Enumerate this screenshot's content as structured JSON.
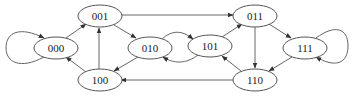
{
  "diagram": {
    "type": "state-transition-graph",
    "nodes": [
      {
        "id": "000",
        "label": "000",
        "cx": 56,
        "cy": 48
      },
      {
        "id": "001",
        "label": "001",
        "cx": 100,
        "cy": 16
      },
      {
        "id": "010",
        "label": "010",
        "cx": 150,
        "cy": 48
      },
      {
        "id": "100",
        "label": "100",
        "cx": 100,
        "cy": 80
      },
      {
        "id": "101",
        "label": "101",
        "cx": 210,
        "cy": 46
      },
      {
        "id": "011",
        "label": "011",
        "cx": 255,
        "cy": 16
      },
      {
        "id": "111",
        "label": "111",
        "cx": 305,
        "cy": 48
      },
      {
        "id": "110",
        "label": "110",
        "cx": 255,
        "cy": 80
      }
    ],
    "edges": [
      {
        "from": "000",
        "to": "000"
      },
      {
        "from": "000",
        "to": "001"
      },
      {
        "from": "001",
        "to": "010"
      },
      {
        "from": "001",
        "to": "011"
      },
      {
        "from": "010",
        "to": "101"
      },
      {
        "from": "101",
        "to": "010"
      },
      {
        "from": "010",
        "to": "100"
      },
      {
        "from": "100",
        "to": "000"
      },
      {
        "from": "100",
        "to": "001"
      },
      {
        "from": "101",
        "to": "011"
      },
      {
        "from": "011",
        "to": "110"
      },
      {
        "from": "011",
        "to": "111"
      },
      {
        "from": "111",
        "to": "111"
      },
      {
        "from": "111",
        "to": "110"
      },
      {
        "from": "110",
        "to": "101"
      },
      {
        "from": "110",
        "to": "100"
      }
    ],
    "colors": {
      "stroke": "#555555",
      "edge": "#666666",
      "text": "#222222",
      "background": "#ffffff"
    }
  }
}
